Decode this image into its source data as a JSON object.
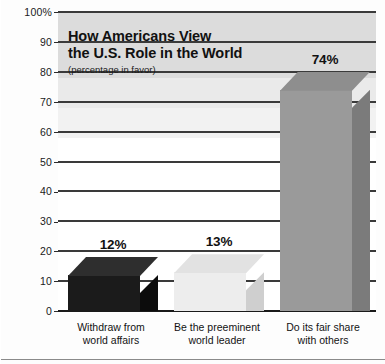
{
  "chart_data": {
    "type": "bar",
    "title": "How Americans View\nthe U.S. Role in the World",
    "subtitle": "(percentage in favor)",
    "xlabel": "",
    "ylabel": "",
    "ylim": [
      0,
      100
    ],
    "grid": true,
    "legend": "none",
    "categories": [
      "Withdraw from\nworld affairs",
      "Be the preeminent\nworld leader",
      "Do its fair share\nwith others"
    ],
    "values": [
      12,
      13,
      74
    ],
    "value_labels": [
      "12%",
      "13%",
      "74%"
    ],
    "bar_colors": [
      "#1b1b1b",
      "#ededed",
      "#9a9a9a"
    ],
    "bar_side_colors": [
      "#0c0c0c",
      "#cfcfcf",
      "#7b7b7b"
    ],
    "bar_top_colors": [
      "#2e2e2e",
      "#e2e2e2",
      "#8e8e8e"
    ],
    "yticks": [
      {
        "value": 100,
        "label": "100%"
      },
      {
        "value": 90,
        "label": "90"
      },
      {
        "value": 80,
        "label": "80"
      },
      {
        "value": 70,
        "label": "70"
      },
      {
        "value": 60,
        "label": "60"
      },
      {
        "value": 50,
        "label": "50"
      },
      {
        "value": 40,
        "label": "40"
      },
      {
        "value": 30,
        "label": "30"
      },
      {
        "value": 20,
        "label": "20"
      },
      {
        "value": 10,
        "label": "10"
      },
      {
        "value": 0,
        "label": "0"
      }
    ]
  }
}
